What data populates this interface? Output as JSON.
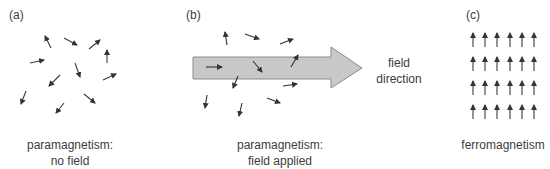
{
  "panels": [
    {
      "id": "a",
      "label": "(a)",
      "caption_line1": "paramagnetism:",
      "caption_line2": "no field"
    },
    {
      "id": "b",
      "label": "(b)",
      "caption_line1": "paramagnetism:",
      "caption_line2": "field applied",
      "arrow_label_line1": "field",
      "arrow_label_line2": "direction"
    },
    {
      "id": "c",
      "label": "(c)",
      "caption_line1": "ferromagnetism"
    }
  ],
  "colors": {
    "spin_arrow": "#3a3a3a",
    "field_arrow_fill": "#c8c8c8",
    "field_arrow_stroke": "#8a8a8a",
    "text": "#3c3c3c"
  },
  "ferromagnet_grid": {
    "rows": 4,
    "cols": 6,
    "direction": "up"
  }
}
